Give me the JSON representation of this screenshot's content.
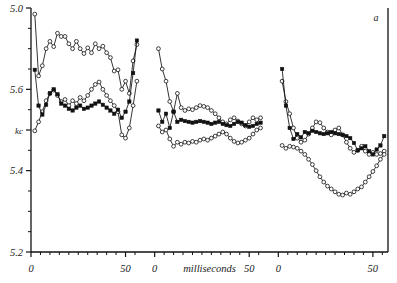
{
  "figure": {
    "panel_label": "a",
    "y_unit_label": "kc",
    "x_axis_label": "milliseconds"
  },
  "chart_data": {
    "type": "line",
    "title": "",
    "subtitle": "",
    "panel_label": "a",
    "xlabel": "milliseconds",
    "ylabel": "kc",
    "ylim": [
      5.2,
      5.8
    ],
    "y_tick_values": [
      5.8,
      5.6,
      5.5,
      5.4,
      5.2
    ],
    "y_tick_labels": [
      "5.0",
      "5.6",
      "kc",
      "5.4",
      "5.2"
    ],
    "y_axis_inverted": false,
    "grid": false,
    "legend": "none",
    "x_tick_labels": [
      "0",
      "50",
      "0",
      "50",
      "0",
      "50"
    ],
    "x_panel_ranges": [
      [
        0,
        58
      ],
      [
        0,
        58
      ],
      [
        0,
        58
      ]
    ],
    "marker_styles": [
      "open-circle",
      "open-circle",
      "filled-square"
    ],
    "panels": [
      {
        "name": "panel-1",
        "xlim": [
          0,
          58
        ],
        "series": [
          {
            "name": "upper-open-circle",
            "marker": "open-circle",
            "x": [
              2,
              4,
              6,
              8,
              10,
              12,
              14,
              16,
              18,
              20,
              22,
              24,
              26,
              28,
              30,
              32,
              34,
              36,
              38,
              40,
              42,
              44,
              46,
              48,
              50,
              52,
              54,
              56
            ],
            "values": [
              5.785,
              5.633,
              5.658,
              5.7,
              5.718,
              5.705,
              5.738,
              5.73,
              5.73,
              5.712,
              5.7,
              5.718,
              5.7,
              5.688,
              5.702,
              5.69,
              5.712,
              5.7,
              5.706,
              5.69,
              5.678,
              5.645,
              5.648,
              5.6,
              5.62,
              5.59,
              5.67,
              5.71
            ]
          },
          {
            "name": "lower-open-circle",
            "marker": "open-circle",
            "x": [
              2,
              4,
              6,
              8,
              10,
              12,
              14,
              16,
              18,
              20,
              22,
              24,
              26,
              28,
              30,
              32,
              34,
              36,
              38,
              40,
              42,
              44,
              46,
              48,
              50,
              52,
              54,
              56
            ],
            "values": [
              5.498,
              5.52,
              5.545,
              5.572,
              5.59,
              5.598,
              5.585,
              5.57,
              5.575,
              5.56,
              5.572,
              5.565,
              5.58,
              5.572,
              5.585,
              5.6,
              5.612,
              5.618,
              5.6,
              5.585,
              5.572,
              5.56,
              5.545,
              5.488,
              5.48,
              5.505,
              5.56,
              5.62
            ]
          },
          {
            "name": "filled-marker",
            "marker": "filled-square",
            "x": [
              2,
              4,
              6,
              8,
              10,
              12,
              14,
              16,
              18,
              20,
              22,
              24,
              26,
              28,
              30,
              32,
              34,
              36,
              38,
              40,
              42,
              44,
              46,
              48,
              50,
              52,
              54,
              56
            ],
            "values": [
              5.648,
              5.56,
              5.538,
              5.562,
              5.59,
              5.6,
              5.588,
              5.565,
              5.56,
              5.552,
              5.548,
              5.555,
              5.56,
              5.552,
              5.555,
              5.56,
              5.565,
              5.57,
              5.562,
              5.555,
              5.548,
              5.54,
              5.55,
              5.53,
              5.545,
              5.57,
              5.64,
              5.72
            ]
          }
        ]
      },
      {
        "name": "panel-2",
        "xlim": [
          0,
          58
        ],
        "series": [
          {
            "name": "upper-open-circle",
            "marker": "open-circle",
            "x": [
              2,
              4,
              6,
              8,
              10,
              12,
              14,
              16,
              18,
              20,
              22,
              24,
              26,
              28,
              30,
              32,
              34,
              36,
              38,
              40,
              42,
              44,
              46,
              48,
              50,
              52,
              54,
              56
            ],
            "values": [
              5.7,
              5.65,
              5.62,
              5.57,
              5.545,
              5.59,
              5.555,
              5.548,
              5.552,
              5.55,
              5.555,
              5.56,
              5.558,
              5.555,
              5.548,
              5.54,
              5.53,
              5.52,
              5.515,
              5.525,
              5.53,
              5.522,
              5.515,
              5.51,
              5.52,
              5.53,
              5.525,
              5.53
            ]
          },
          {
            "name": "lower-open-circle",
            "marker": "open-circle",
            "x": [
              2,
              4,
              6,
              8,
              10,
              12,
              14,
              16,
              18,
              20,
              22,
              24,
              26,
              28,
              30,
              32,
              34,
              36,
              38,
              40,
              42,
              44,
              46,
              48,
              50,
              52,
              54,
              56
            ],
            "values": [
              5.51,
              5.495,
              5.5,
              5.478,
              5.46,
              5.47,
              5.465,
              5.47,
              5.468,
              5.472,
              5.47,
              5.475,
              5.478,
              5.475,
              5.48,
              5.485,
              5.49,
              5.495,
              5.49,
              5.48,
              5.472,
              5.468,
              5.47,
              5.475,
              5.48,
              5.49,
              5.5,
              5.505
            ]
          },
          {
            "name": "filled-marker",
            "marker": "filled-square",
            "x": [
              2,
              4,
              6,
              8,
              10,
              12,
              14,
              16,
              18,
              20,
              22,
              24,
              26,
              28,
              30,
              32,
              34,
              36,
              38,
              40,
              42,
              44,
              46,
              48,
              50,
              52,
              54,
              56
            ],
            "values": [
              5.548,
              5.52,
              5.54,
              5.505,
              5.545,
              5.52,
              5.525,
              5.522,
              5.52,
              5.518,
              5.52,
              5.522,
              5.52,
              5.518,
              5.515,
              5.518,
              5.52,
              5.515,
              5.512,
              5.51,
              5.515,
              5.52,
              5.518,
              5.512,
              5.508,
              5.51,
              5.515,
              5.518
            ]
          }
        ]
      },
      {
        "name": "panel-3",
        "xlim": [
          0,
          58
        ],
        "series": [
          {
            "name": "upper-open-circle",
            "marker": "open-circle",
            "x": [
              2,
              4,
              6,
              8,
              10,
              12,
              14,
              16,
              18,
              20,
              22,
              24,
              26,
              28,
              30,
              32,
              34,
              36,
              38,
              40,
              42,
              44,
              46,
              48,
              50,
              52,
              54,
              56
            ],
            "values": [
              5.62,
              5.57,
              5.54,
              5.505,
              5.48,
              5.47,
              5.475,
              5.49,
              5.505,
              5.52,
              5.518,
              5.505,
              5.495,
              5.488,
              5.5,
              5.505,
              5.488,
              5.47,
              5.455,
              5.445,
              5.45,
              5.46,
              5.448,
              5.44,
              5.445,
              5.44,
              5.442,
              5.448
            ]
          },
          {
            "name": "lower-open-circle",
            "marker": "open-circle",
            "x": [
              2,
              4,
              6,
              8,
              10,
              12,
              14,
              16,
              18,
              20,
              22,
              24,
              26,
              28,
              30,
              32,
              34,
              36,
              38,
              40,
              42,
              44,
              46,
              48,
              50,
              52,
              54,
              56
            ],
            "values": [
              5.462,
              5.455,
              5.46,
              5.458,
              5.455,
              5.448,
              5.44,
              5.428,
              5.415,
              5.4,
              5.385,
              5.372,
              5.362,
              5.355,
              5.348,
              5.342,
              5.34,
              5.345,
              5.342,
              5.348,
              5.355,
              5.36,
              5.372,
              5.385,
              5.398,
              5.412,
              5.428,
              5.44
            ]
          },
          {
            "name": "filled-marker",
            "marker": "filled-square",
            "x": [
              2,
              4,
              6,
              8,
              10,
              12,
              14,
              16,
              18,
              20,
              22,
              24,
              26,
              28,
              30,
              32,
              34,
              36,
              38,
              40,
              42,
              44,
              46,
              48,
              50,
              52,
              54,
              56
            ],
            "values": [
              5.65,
              5.56,
              5.505,
              5.478,
              5.49,
              5.482,
              5.495,
              5.492,
              5.498,
              5.495,
              5.492,
              5.49,
              5.492,
              5.495,
              5.492,
              5.49,
              5.488,
              5.485,
              5.48,
              5.468,
              5.45,
              5.455,
              5.46,
              5.448,
              5.44,
              5.452,
              5.462,
              5.485
            ]
          }
        ]
      }
    ]
  }
}
